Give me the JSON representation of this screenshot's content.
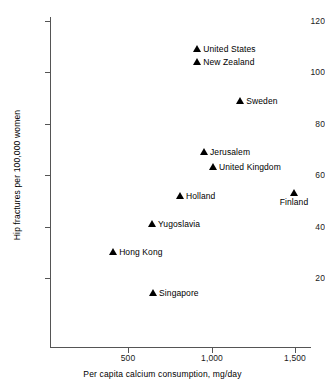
{
  "chart_data": {
    "type": "scatter",
    "title": "",
    "xlabel": "Per capita calcium consumption, mg/day",
    "ylabel": "Hip fractures per 100,000 women",
    "xlim": [
      80,
      1580
    ],
    "ylim": [
      7,
      123
    ],
    "xticks": [
      500,
      1000,
      1500
    ],
    "xtick_labels": [
      "500",
      "1,000",
      "1,500"
    ],
    "yticks": [
      20,
      40,
      60,
      80,
      100,
      120
    ],
    "ytick_labels": [
      "20",
      "40",
      "60",
      "80",
      "100",
      "120"
    ],
    "grid": false,
    "legend": "none",
    "marker": "triangle-up",
    "marker_color": "#000000",
    "points": [
      {
        "label": "United States",
        "x": 915,
        "y": 109,
        "label_pos": "right"
      },
      {
        "label": "New Zealand",
        "x": 915,
        "y": 104,
        "label_pos": "right"
      },
      {
        "label": "Sweden",
        "x": 1172,
        "y": 89,
        "label_pos": "right"
      },
      {
        "label": "Jerusalem",
        "x": 955,
        "y": 69,
        "label_pos": "right"
      },
      {
        "label": "United Kingdom",
        "x": 1009,
        "y": 63,
        "label_pos": "right"
      },
      {
        "label": "Holland",
        "x": 811,
        "y": 52,
        "label_pos": "right"
      },
      {
        "label": "Finland",
        "x": 1494,
        "y": 53,
        "label_pos": "below"
      },
      {
        "label": "Yugoslavia",
        "x": 644,
        "y": 41,
        "label_pos": "right"
      },
      {
        "label": "Hong Kong",
        "x": 411,
        "y": 30,
        "label_pos": "right"
      },
      {
        "label": "Singapore",
        "x": 650,
        "y": 14,
        "label_pos": "right"
      }
    ]
  }
}
